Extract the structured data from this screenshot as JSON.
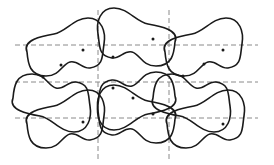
{
  "diagram": {
    "colors": {
      "background": "#ffffff",
      "outline": "#1a1a1a",
      "grid": "#8a8a8a"
    },
    "grid": {
      "horizontal_y": [
        45,
        82,
        118
      ],
      "horizontal_x_range": [
        15,
        258
      ],
      "vertical_x": [
        98,
        169
      ],
      "vertical_y_range": [
        10,
        160
      ],
      "style": "dashed"
    },
    "cells": {
      "rows": 3,
      "columns": 3,
      "description": "Outer columns share one peanut-shaped blob; middle column holds the same blob rotated 180 degrees. Each blob contains a marker dot."
    }
  }
}
